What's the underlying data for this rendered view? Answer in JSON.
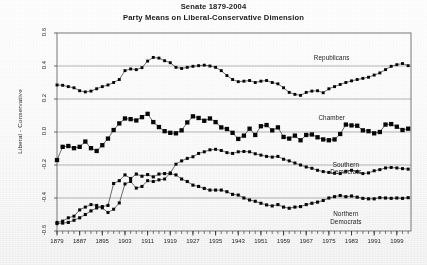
{
  "title": {
    "line1": "Senate 1879-2004",
    "line2": "Party Means on Liberal-Conservative Dimension"
  },
  "axes": {
    "ylabel": "Liberal - Conservative",
    "yticks": [
      "0.6",
      "0.4",
      "0.2",
      "0.0",
      "-0.2",
      "-0.4",
      "-0.6"
    ],
    "xticks": [
      "1879",
      "1887",
      "1895",
      "1903",
      "1911",
      "1919",
      "1927",
      "1935",
      "1943",
      "1951",
      "1959",
      "1967",
      "1975",
      "1983",
      "1991",
      "1999"
    ]
  },
  "annotations": {
    "republicans": "Republicans",
    "chamber": "Chamber",
    "southern_democrats_l1": "Southern",
    "southern_democrats_l2": "Democrats",
    "northern_democrats_l1": "Northern",
    "northern_democrats_l2": "Democrats"
  },
  "chart_data": {
    "type": "line",
    "xlabel": "",
    "ylabel": "Liberal - Conservative",
    "xlim": [
      1879,
      2004
    ],
    "ylim": [
      -0.6,
      0.6
    ],
    "grid": true,
    "gridlines_y": [
      0.4,
      0.2,
      0.0,
      -0.2,
      -0.4
    ],
    "legend": "inline annotations at right of each series",
    "marker": "filled-square",
    "color": "#000000",
    "x": [
      1879,
      1881,
      1883,
      1885,
      1887,
      1889,
      1891,
      1893,
      1895,
      1897,
      1899,
      1901,
      1903,
      1905,
      1907,
      1909,
      1911,
      1913,
      1915,
      1917,
      1919,
      1921,
      1923,
      1925,
      1927,
      1929,
      1931,
      1933,
      1935,
      1937,
      1939,
      1941,
      1943,
      1945,
      1947,
      1949,
      1951,
      1953,
      1955,
      1957,
      1959,
      1961,
      1963,
      1965,
      1967,
      1969,
      1971,
      1973,
      1975,
      1977,
      1979,
      1981,
      1983,
      1985,
      1987,
      1989,
      1991,
      1993,
      1995,
      1997,
      1999,
      2001,
      2003
    ],
    "series": [
      {
        "name": "Republicans",
        "values": [
          0.285,
          0.283,
          0.275,
          0.268,
          0.25,
          0.243,
          0.248,
          0.262,
          0.275,
          0.285,
          0.3,
          0.318,
          0.372,
          0.382,
          0.378,
          0.39,
          0.43,
          0.452,
          0.448,
          0.432,
          0.42,
          0.392,
          0.385,
          0.392,
          0.398,
          0.402,
          0.405,
          0.4,
          0.392,
          0.372,
          0.342,
          0.318,
          0.305,
          0.308,
          0.312,
          0.3,
          0.308,
          0.312,
          0.3,
          0.292,
          0.268,
          0.24,
          0.228,
          0.222,
          0.24,
          0.248,
          0.25,
          0.238,
          0.262,
          0.275,
          0.288,
          0.3,
          0.31,
          0.318,
          0.325,
          0.332,
          0.345,
          0.358,
          0.378,
          0.398,
          0.408,
          0.415,
          0.402
        ]
      },
      {
        "name": "Chamber",
        "values": [
          -0.17,
          -0.09,
          -0.085,
          -0.098,
          -0.09,
          -0.058,
          -0.098,
          -0.115,
          -0.08,
          -0.04,
          0.012,
          0.052,
          0.082,
          0.078,
          0.07,
          0.09,
          0.11,
          0.06,
          0.03,
          0.005,
          -0.005,
          -0.008,
          0.01,
          0.058,
          0.095,
          0.085,
          0.068,
          0.082,
          0.06,
          0.028,
          0.018,
          -0.005,
          -0.042,
          -0.022,
          0.02,
          -0.018,
          0.035,
          0.042,
          0.01,
          0.028,
          -0.03,
          -0.04,
          -0.022,
          -0.05,
          -0.018,
          -0.015,
          -0.032,
          -0.045,
          -0.05,
          -0.045,
          -0.012,
          0.045,
          0.04,
          0.038,
          0.01,
          0.005,
          -0.008,
          0.0,
          0.045,
          0.048,
          0.032,
          0.012,
          0.02
        ]
      },
      {
        "name": "Southern Democrats",
        "values": [
          -0.548,
          -0.54,
          -0.52,
          -0.51,
          -0.472,
          -0.455,
          -0.44,
          -0.445,
          -0.46,
          -0.488,
          -0.468,
          -0.43,
          -0.315,
          -0.3,
          -0.34,
          -0.33,
          -0.295,
          -0.3,
          -0.29,
          -0.285,
          -0.248,
          -0.195,
          -0.175,
          -0.16,
          -0.15,
          -0.13,
          -0.12,
          -0.108,
          -0.105,
          -0.112,
          -0.125,
          -0.13,
          -0.12,
          -0.118,
          -0.12,
          -0.132,
          -0.14,
          -0.148,
          -0.152,
          -0.148,
          -0.165,
          -0.175,
          -0.188,
          -0.2,
          -0.212,
          -0.22,
          -0.232,
          -0.24,
          -0.245,
          -0.25,
          -0.252,
          -0.238,
          -0.232,
          -0.24,
          -0.252,
          -0.248,
          -0.235,
          -0.228,
          -0.218,
          -0.215,
          -0.218,
          -0.222,
          -0.225
        ]
      },
      {
        "name": "Northern Democrats",
        "values": [
          -0.555,
          -0.552,
          -0.548,
          -0.535,
          -0.52,
          -0.5,
          -0.478,
          -0.46,
          -0.452,
          -0.445,
          -0.312,
          -0.295,
          -0.26,
          -0.282,
          -0.255,
          -0.268,
          -0.258,
          -0.272,
          -0.255,
          -0.252,
          -0.252,
          -0.26,
          -0.285,
          -0.3,
          -0.322,
          -0.33,
          -0.342,
          -0.352,
          -0.352,
          -0.352,
          -0.362,
          -0.378,
          -0.382,
          -0.4,
          -0.412,
          -0.42,
          -0.432,
          -0.442,
          -0.448,
          -0.44,
          -0.455,
          -0.462,
          -0.455,
          -0.452,
          -0.44,
          -0.432,
          -0.425,
          -0.415,
          -0.4,
          -0.392,
          -0.385,
          -0.392,
          -0.388,
          -0.395,
          -0.402,
          -0.405,
          -0.405,
          -0.398,
          -0.4,
          -0.402,
          -0.4,
          -0.402,
          -0.398
        ]
      }
    ]
  }
}
